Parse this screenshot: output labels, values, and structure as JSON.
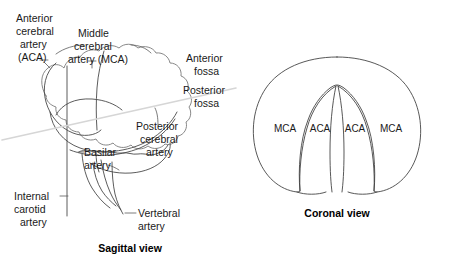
{
  "figure": {
    "background_color": "#ffffff",
    "ink_color": "#1a1a1a",
    "outline_color": "#7b7b7b",
    "fossa_line_color": "#d6d6d6"
  },
  "sagittal": {
    "caption": "Sagittal view",
    "labels": {
      "aca_line1": "Anterior",
      "aca_line2": "cerebral",
      "aca_line3": "artery",
      "aca_line4": "(ACA)",
      "mca_line1": "Middle",
      "mca_line2": "cerebral",
      "mca_line3": "artery (MCA)",
      "anterior_fossa_line1": "Anterior",
      "anterior_fossa_line2": "fossa",
      "posterior_fossa_line1": "Posterior",
      "posterior_fossa_line2": "fossa",
      "pca_line1": "Posterior",
      "pca_line2": "cerebral",
      "pca_line3": "artery",
      "basilar_line1": "Basilar",
      "basilar_line2": "artery",
      "ica_line1": "Internal",
      "ica_line2": "carotid",
      "ica_line3": "artery",
      "vertebral_line1": "Vertebral",
      "vertebral_line2": "artery"
    }
  },
  "coronal": {
    "caption": "Coronal view",
    "labels": {
      "mca_left": "MCA",
      "aca_left": "ACA",
      "aca_right": "ACA",
      "mca_right": "MCA"
    }
  }
}
